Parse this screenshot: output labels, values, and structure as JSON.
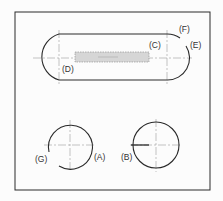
{
  "diagram": {
    "type": "technical drawing - slot and circles with sketch constraints",
    "labels": {
      "A": "(A)",
      "B": "(B)",
      "C": "(C)",
      "D": "(D)",
      "E": "(E)",
      "F": "(F)",
      "G": "(G)"
    },
    "colors": {
      "line": "#2a2a2a",
      "centerline": "#9a9a9a",
      "shade": "#d6d6d6",
      "background": "#fcfcfc"
    }
  }
}
